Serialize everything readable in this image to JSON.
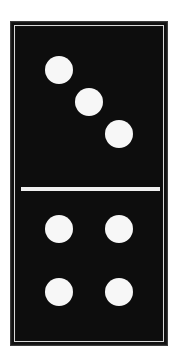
{
  "domino": {
    "top_half": {
      "value": 3,
      "pips": [
        {
          "cx": 59,
          "cy": 70
        },
        {
          "cx": 89,
          "cy": 102
        },
        {
          "cx": 119,
          "cy": 134
        }
      ]
    },
    "bottom_half": {
      "value": 4,
      "pips": [
        {
          "cx": 59,
          "cy": 229
        },
        {
          "cx": 119,
          "cy": 229
        },
        {
          "cx": 59,
          "cy": 292
        },
        {
          "cx": 119,
          "cy": 292
        }
      ]
    },
    "colors": {
      "body": "#111111",
      "pip": "#f7f7f7",
      "divider": "#efefef",
      "border_line": "#d8d8d8",
      "background": "#ffffff"
    }
  }
}
